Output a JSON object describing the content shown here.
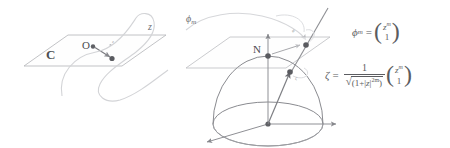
{
  "figure": {
    "background_color": "#ffffff",
    "ink_color": "#5b5c60",
    "faint_ink_color": "#c9cacd"
  },
  "labels": {
    "complex_plane": "C",
    "origin": "O",
    "north_pole": "N",
    "source_point": "z",
    "source_point_tiny": "z",
    "map_curve": "ϕ",
    "map_curve_sub": "m",
    "plane_point_tiny": "ϕ",
    "sphere_point_tiny": "ζ"
  },
  "formulas": {
    "phi_map": {
      "lhs_symbol": "ϕ",
      "lhs_subscript": "m",
      "equals": "=",
      "vector_top": "z",
      "vector_top_exponent": "m",
      "vector_bottom": "1"
    },
    "zeta_map": {
      "lhs_symbol": "ζ",
      "equals": "=",
      "numerator": "1",
      "radical_sign": "√",
      "denominator_open": "(1+|",
      "denominator_var": "z",
      "denominator_abs_close": "|",
      "denominator_exponent": "2m",
      "denominator_close": ")",
      "vector_top": "z",
      "vector_top_exponent": "m",
      "vector_bottom": "1"
    }
  },
  "geometry": {
    "left_plane_label": "C",
    "left_plane_points": [
      "O",
      "z"
    ],
    "right_plane_label": "tangent plane at N",
    "sphere_elements": [
      "equator",
      "meridian-outline",
      "center",
      "axes"
    ],
    "projection_line": "line from sphere center through sphere point to tangent plane"
  }
}
